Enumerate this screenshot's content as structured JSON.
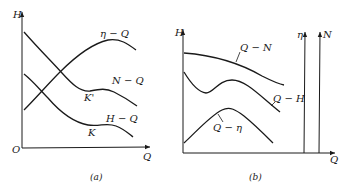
{
  "panel_a": {
    "caption": "(a)",
    "y_axis_label": "H",
    "x_axis_label": "Q",
    "origin_label": "O",
    "curves": [
      {
        "id": "eta-q",
        "label": "η − Q"
      },
      {
        "id": "n-q",
        "label": "N − Q",
        "point_label": "K'"
      },
      {
        "id": "h-q",
        "label": "H − Q",
        "point_label": "K"
      }
    ]
  },
  "panel_b": {
    "caption": "(b)",
    "y_axis_label": "H",
    "x_axis_label": "Q",
    "right_axes": [
      {
        "id": "eta-axis",
        "label": "η"
      },
      {
        "id": "n-axis",
        "label": "N"
      }
    ],
    "curves": [
      {
        "id": "q-n",
        "label": "Q − N"
      },
      {
        "id": "q-h",
        "label": "Q − H"
      },
      {
        "id": "q-eta",
        "label": "Q − η"
      }
    ]
  }
}
